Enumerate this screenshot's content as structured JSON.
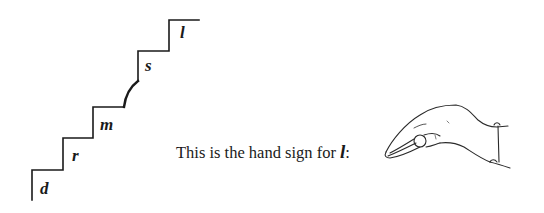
{
  "staircase": {
    "steps": [
      {
        "label": "d"
      },
      {
        "label": "r"
      },
      {
        "label": "m"
      },
      {
        "label": "s"
      },
      {
        "label": "l"
      }
    ],
    "stroke_color": "#1a1a1a"
  },
  "caption": {
    "text": "This is the hand sign for",
    "letter": "l",
    "suffix": ":"
  },
  "illustration": {
    "icon": "hand-sign-l-icon"
  }
}
